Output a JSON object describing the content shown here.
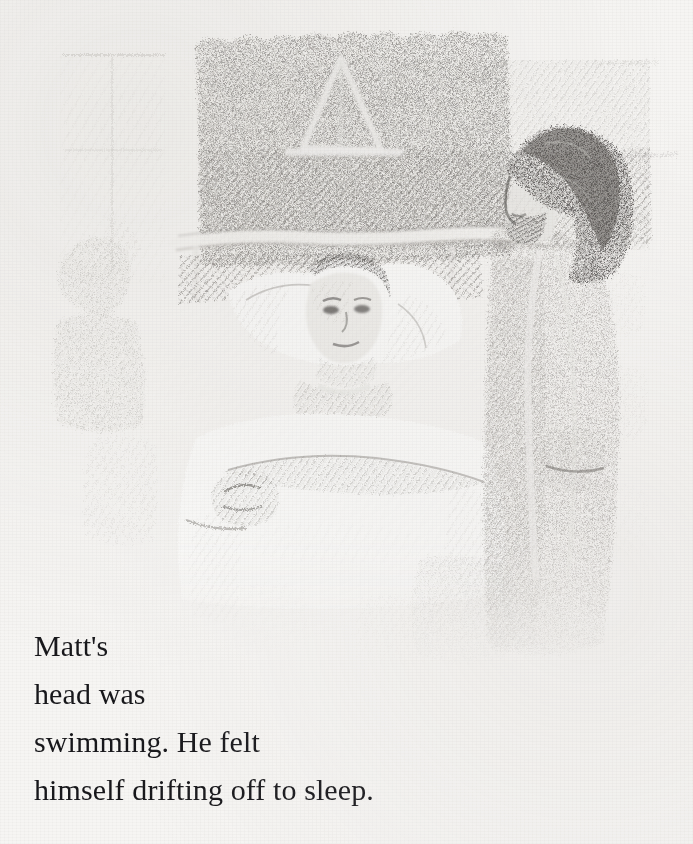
{
  "page": {
    "kind": "illustrated-book-page",
    "width": 693,
    "height": 844,
    "paper_color": "#f6f5f3",
    "ink_color": "#16161a"
  },
  "illustration": {
    "name": "hospital-bed-pencil-sketch",
    "medium": "graphite pencil drawing, hatched shading",
    "caption_alt": "A boy lying propped up in a hospital bed with pillows, a dark hatched wall and a triangular traction frame behind him, a visitor with dark wavy hair standing at the bedside on the right, and a faint window with curtains at the left.",
    "tone_min": "#3a3a3c",
    "tone_max": "#f6f5f3",
    "elements": [
      {
        "name": "background-wall",
        "label": "dark hatched wall"
      },
      {
        "name": "traction-frame",
        "label": "triangular frame over bed"
      },
      {
        "name": "bed-headboard-rail",
        "label": "horizontal bed rail"
      },
      {
        "name": "pillow",
        "label": "pillows behind patient"
      },
      {
        "name": "patient-head",
        "label": "boy's head and face"
      },
      {
        "name": "blanket",
        "label": "white bed blanket"
      },
      {
        "name": "patient-hand",
        "label": "patient's hand on blanket"
      },
      {
        "name": "visitor-figure",
        "label": "standing visitor"
      },
      {
        "name": "visitor-hair",
        "label": "dark wavy hair"
      },
      {
        "name": "window-curtain",
        "label": "faint window and curtain at left"
      },
      {
        "name": "left-figure",
        "label": "faint figure at far left"
      }
    ]
  },
  "body_text": {
    "lines": [
      "Matt's",
      "head was",
      "swimming. He felt",
      "himself drifting off to sleep."
    ],
    "full_text": "Matt's head was swimming. He felt himself drifting off to sleep.",
    "font_size_px": 30,
    "line_height_px": 48,
    "align": "left"
  }
}
